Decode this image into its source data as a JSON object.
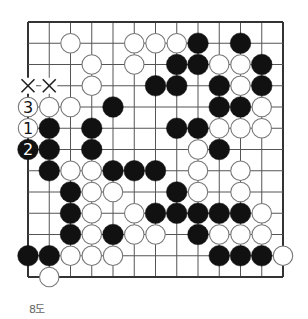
{
  "diagram": {
    "type": "go-board-diagram",
    "caption": "8도",
    "grid": {
      "cols": 13,
      "rows": 13,
      "origin_x": 28,
      "origin_y": 22,
      "spacing": 21.25,
      "edges": [
        "top",
        "left",
        "right",
        "bottom"
      ]
    },
    "colors": {
      "line": "#555555",
      "edge": "#333333",
      "black_stone": "#111111",
      "white_stone": "#ffffff",
      "white_outline": "#777777",
      "caption": "#666666"
    },
    "stones": [
      {
        "col": 2,
        "row": 1,
        "color": "white"
      },
      {
        "col": 5,
        "row": 1,
        "color": "white"
      },
      {
        "col": 6,
        "row": 1,
        "color": "white"
      },
      {
        "col": 7,
        "row": 1,
        "color": "white"
      },
      {
        "col": 8,
        "row": 1,
        "color": "black"
      },
      {
        "col": 10,
        "row": 1,
        "color": "black"
      },
      {
        "col": 3,
        "row": 2,
        "color": "white"
      },
      {
        "col": 5,
        "row": 2,
        "color": "white"
      },
      {
        "col": 7,
        "row": 2,
        "color": "black"
      },
      {
        "col": 8,
        "row": 2,
        "color": "black"
      },
      {
        "col": 9,
        "row": 2,
        "color": "white"
      },
      {
        "col": 10,
        "row": 2,
        "color": "white"
      },
      {
        "col": 11,
        "row": 2,
        "color": "black"
      },
      {
        "col": 3,
        "row": 3,
        "color": "white"
      },
      {
        "col": 6,
        "row": 3,
        "color": "black"
      },
      {
        "col": 7,
        "row": 3,
        "color": "black"
      },
      {
        "col": 9,
        "row": 3,
        "color": "black"
      },
      {
        "col": 10,
        "row": 3,
        "color": "white"
      },
      {
        "col": 11,
        "row": 3,
        "color": "black"
      },
      {
        "col": 0,
        "row": 4,
        "color": "white",
        "label": "3"
      },
      {
        "col": 1,
        "row": 4,
        "color": "white"
      },
      {
        "col": 2,
        "row": 4,
        "color": "white"
      },
      {
        "col": 4,
        "row": 4,
        "color": "black"
      },
      {
        "col": 9,
        "row": 4,
        "color": "black"
      },
      {
        "col": 10,
        "row": 4,
        "color": "black"
      },
      {
        "col": 11,
        "row": 4,
        "color": "white"
      },
      {
        "col": 0,
        "row": 5,
        "color": "white",
        "label": "1"
      },
      {
        "col": 1,
        "row": 5,
        "color": "black"
      },
      {
        "col": 3,
        "row": 5,
        "color": "black"
      },
      {
        "col": 7,
        "row": 5,
        "color": "black"
      },
      {
        "col": 8,
        "row": 5,
        "color": "black"
      },
      {
        "col": 9,
        "row": 5,
        "color": "white"
      },
      {
        "col": 10,
        "row": 5,
        "color": "white"
      },
      {
        "col": 11,
        "row": 5,
        "color": "white"
      },
      {
        "col": 0,
        "row": 6,
        "color": "black",
        "label": "2"
      },
      {
        "col": 1,
        "row": 6,
        "color": "black"
      },
      {
        "col": 3,
        "row": 6,
        "color": "black"
      },
      {
        "col": 8,
        "row": 6,
        "color": "white"
      },
      {
        "col": 9,
        "row": 6,
        "color": "black"
      },
      {
        "col": 1,
        "row": 7,
        "color": "black"
      },
      {
        "col": 2,
        "row": 7,
        "color": "white"
      },
      {
        "col": 3,
        "row": 7,
        "color": "white"
      },
      {
        "col": 4,
        "row": 7,
        "color": "black"
      },
      {
        "col": 5,
        "row": 7,
        "color": "black"
      },
      {
        "col": 6,
        "row": 7,
        "color": "black"
      },
      {
        "col": 8,
        "row": 7,
        "color": "white"
      },
      {
        "col": 10,
        "row": 7,
        "color": "white"
      },
      {
        "col": 2,
        "row": 8,
        "color": "black"
      },
      {
        "col": 3,
        "row": 8,
        "color": "white"
      },
      {
        "col": 4,
        "row": 8,
        "color": "white"
      },
      {
        "col": 7,
        "row": 8,
        "color": "black"
      },
      {
        "col": 8,
        "row": 8,
        "color": "white"
      },
      {
        "col": 10,
        "row": 8,
        "color": "white"
      },
      {
        "col": 2,
        "row": 9,
        "color": "black"
      },
      {
        "col": 3,
        "row": 9,
        "color": "white"
      },
      {
        "col": 5,
        "row": 9,
        "color": "white"
      },
      {
        "col": 6,
        "row": 9,
        "color": "black"
      },
      {
        "col": 7,
        "row": 9,
        "color": "black"
      },
      {
        "col": 8,
        "row": 9,
        "color": "black"
      },
      {
        "col": 9,
        "row": 9,
        "color": "black"
      },
      {
        "col": 10,
        "row": 9,
        "color": "black"
      },
      {
        "col": 11,
        "row": 9,
        "color": "white"
      },
      {
        "col": 2,
        "row": 10,
        "color": "black"
      },
      {
        "col": 3,
        "row": 10,
        "color": "white"
      },
      {
        "col": 4,
        "row": 10,
        "color": "black"
      },
      {
        "col": 5,
        "row": 10,
        "color": "white"
      },
      {
        "col": 6,
        "row": 10,
        "color": "white"
      },
      {
        "col": 8,
        "row": 10,
        "color": "black"
      },
      {
        "col": 9,
        "row": 10,
        "color": "white"
      },
      {
        "col": 10,
        "row": 10,
        "color": "white"
      },
      {
        "col": 11,
        "row": 10,
        "color": "white"
      },
      {
        "col": 0,
        "row": 11,
        "color": "black"
      },
      {
        "col": 1,
        "row": 11,
        "color": "black"
      },
      {
        "col": 2,
        "row": 11,
        "color": "white"
      },
      {
        "col": 3,
        "row": 11,
        "color": "white"
      },
      {
        "col": 4,
        "row": 11,
        "color": "white"
      },
      {
        "col": 9,
        "row": 11,
        "color": "black"
      },
      {
        "col": 10,
        "row": 11,
        "color": "black"
      },
      {
        "col": 11,
        "row": 11,
        "color": "black"
      },
      {
        "col": 12,
        "row": 11,
        "color": "white"
      },
      {
        "col": 1,
        "row": 12,
        "color": "white"
      }
    ],
    "marks": [
      {
        "col": 0,
        "row": 3,
        "symbol": "×"
      },
      {
        "col": 1,
        "row": 3,
        "symbol": "×"
      }
    ]
  }
}
